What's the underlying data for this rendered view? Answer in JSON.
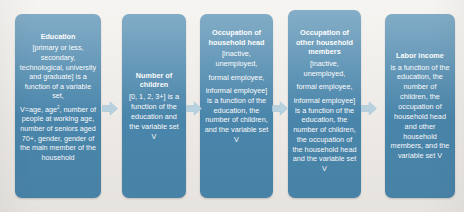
{
  "diagram": {
    "type": "horizontal-flowchart",
    "node_fill_color": "#4b88ae",
    "node_text_color": "#ffffff",
    "arrow_color": "#b9d4e3",
    "background_color": "#f2efeb",
    "nodes": [
      {
        "id": "education",
        "title": "Education",
        "paragraphs": [
          "[primary or less, secondary, technological, university and graduate] is a function of a variable set,",
          "V=age, age², number of people at working age, number of seniors aged 70+, gender, gender of the main member of the household"
        ]
      },
      {
        "id": "children",
        "title": "Number of children",
        "paragraphs": [
          "[0, 1, 2, 3+] is a function of the education and the variable set V"
        ]
      },
      {
        "id": "occupation-household-head",
        "title": "Occupation of household head",
        "paragraphs": [
          "[inactive, unemployed,",
          "formal employee,",
          "informal employee] is a function of the education, the number of children, and the variable set V"
        ]
      },
      {
        "id": "occupation-other-members",
        "title": "Occupation of other household members",
        "paragraphs": [
          "[inactive, unemployed,",
          "formal employee,",
          "informal employee] is a function of the education, the number of children, the occupation of the household head and the variable set  V"
        ]
      },
      {
        "id": "labor-income",
        "title": "Labor income",
        "paragraphs": [
          "is a function of the education, the number of children, the occupation of household head and other household members, and the variable set V"
        ]
      }
    ],
    "connectors": [
      {
        "id": "arrow-1",
        "icon": "right-arrow-icon",
        "from": "education",
        "to": "children"
      },
      {
        "id": "arrow-2",
        "icon": "right-arrow-icon",
        "from": "children",
        "to": "occupation-household-head"
      },
      {
        "id": "arrow-3",
        "icon": "right-arrow-icon",
        "from": "occupation-household-head",
        "to": "occupation-other-members"
      },
      {
        "id": "arrow-4",
        "icon": "right-arrow-icon",
        "from": "occupation-other-members",
        "to": "labor-income"
      }
    ]
  }
}
